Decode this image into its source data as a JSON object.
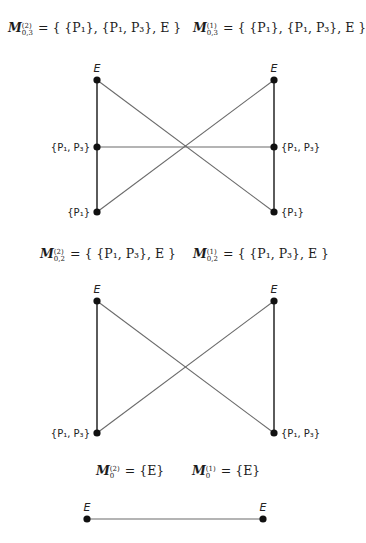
{
  "sections": [
    {
      "formulas": [
        {
          "name": "M",
          "sup": "(2)",
          "sub": "0,3",
          "rhs": "= { {P₁}, {P₁, P₃}, E }"
        },
        {
          "name": "M",
          "sup": "(1)",
          "sub": "0,3",
          "rhs": "= { {P₁}, {P₁, P₃}, E }"
        }
      ],
      "graph": {
        "nodes": [
          {
            "id": "L-E",
            "label": "E",
            "x": 97,
            "y": 80
          },
          {
            "id": "L-P1P3",
            "label": "{P₁, P₃}",
            "x": 97,
            "y": 147
          },
          {
            "id": "L-P1",
            "label": "{P₁}",
            "x": 97,
            "y": 212
          },
          {
            "id": "R-E",
            "label": "E",
            "x": 274,
            "y": 80
          },
          {
            "id": "R-P1P3",
            "label": "{P₁, P₃}",
            "x": 274,
            "y": 147
          },
          {
            "id": "R-P1",
            "label": "{P₁}",
            "x": 274,
            "y": 212
          }
        ],
        "edges": [
          [
            "L-E",
            "L-P1P3"
          ],
          [
            "L-P1P3",
            "L-P1"
          ],
          [
            "R-E",
            "R-P1P3"
          ],
          [
            "R-P1P3",
            "R-P1"
          ],
          [
            "L-P1P3",
            "R-P1P3"
          ],
          [
            "L-E",
            "R-P1"
          ],
          [
            "R-E",
            "L-P1"
          ]
        ]
      }
    },
    {
      "formulas": [
        {
          "name": "M",
          "sup": "(2)",
          "sub": "0,2",
          "rhs": "= { {P₁, P₃}, E }"
        },
        {
          "name": "M",
          "sup": "(1)",
          "sub": "0,2",
          "rhs": "= { {P₁, P₃}, E }"
        }
      ],
      "graph": {
        "nodes": [
          {
            "id": "L-E",
            "label": "E",
            "x": 97,
            "y": 301
          },
          {
            "id": "L-P1P3",
            "label": "{P₁, P₃}",
            "x": 97,
            "y": 433
          },
          {
            "id": "R-E",
            "label": "E",
            "x": 274,
            "y": 301
          },
          {
            "id": "R-P1P3",
            "label": "{P₁, P₃}",
            "x": 274,
            "y": 433
          }
        ],
        "edges": [
          [
            "L-E",
            "L-P1P3"
          ],
          [
            "R-E",
            "R-P1P3"
          ],
          [
            "L-E",
            "R-P1P3"
          ],
          [
            "R-E",
            "L-P1P3"
          ]
        ]
      }
    },
    {
      "formulas": [
        {
          "name": "M",
          "sup": "(2)",
          "sub": "0",
          "rhs": "= {E}"
        },
        {
          "name": "M",
          "sup": "(1)",
          "sub": "0",
          "rhs": "= {E}"
        }
      ],
      "graph": {
        "nodes": [
          {
            "id": "L-E",
            "label": "E",
            "x": 87,
            "y": 519
          },
          {
            "id": "R-E",
            "label": "E",
            "x": 263,
            "y": 519
          }
        ],
        "edges": [
          [
            "L-E",
            "R-E"
          ]
        ]
      }
    }
  ],
  "colors": {
    "line": "#6b6b6b",
    "node": "#111111",
    "text": "#1c1c1c"
  }
}
